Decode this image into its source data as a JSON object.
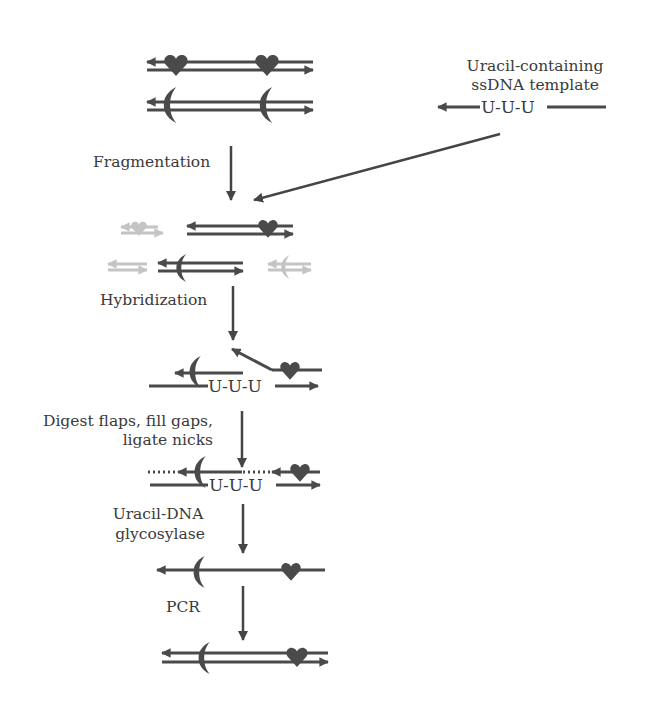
{
  "diagram": {
    "template": {
      "title_line1": "Uracil-containing",
      "title_line2": "ssDNA template",
      "sequence": "U-U-U"
    },
    "steps": [
      {
        "label_lines": [
          "Fragmentation"
        ]
      },
      {
        "label_lines": [
          "Hybridization"
        ]
      },
      {
        "label_lines": [
          "Digest flaps, fill gaps,",
          "ligate nicks"
        ]
      },
      {
        "label_lines": [
          "Uracil-DNA",
          "glycosylase"
        ]
      },
      {
        "label_lines": [
          "PCR"
        ]
      }
    ],
    "hybrid_sequence": "U-U-U",
    "ligated_sequence": "U-U-U",
    "markers": {
      "heart": "heart-marker",
      "crescent": "crescent-marker"
    },
    "colors": {
      "strand": "#4a4a4a",
      "faded_fragment": "#c4c4c4",
      "text": "#3a3a3a",
      "background": "#ffffff"
    }
  }
}
